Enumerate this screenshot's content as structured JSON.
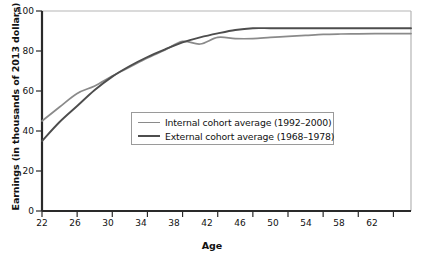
{
  "chart_data": {
    "type": "line",
    "title": "",
    "xlabel": "Age",
    "ylabel": "Earnings (in thousands of 2013 dollars)",
    "xlim": [
      22,
      64
    ],
    "ylim": [
      0,
      100
    ],
    "xticks": [
      22,
      26,
      30,
      34,
      38,
      42,
      46,
      50,
      54,
      58,
      62
    ],
    "yticks": [
      0,
      20,
      40,
      60,
      80,
      100
    ],
    "grid": false,
    "legend_position": "center",
    "x": [
      22,
      24,
      26,
      28,
      30,
      32,
      34,
      36,
      38,
      40,
      42,
      44,
      46,
      48,
      50,
      52,
      54,
      56,
      58,
      60,
      62,
      64
    ],
    "series": [
      {
        "name": "Internal cohort average (1992–2000)",
        "color": "#8a8a8a",
        "values": [
          45.0,
          52.0,
          58.8,
          62.5,
          67.5,
          72.0,
          76.5,
          80.5,
          84.8,
          83.5,
          86.8,
          86.2,
          86.2,
          86.8,
          87.3,
          87.8,
          88.3,
          88.5,
          88.6,
          88.7,
          88.7,
          88.7
        ]
      },
      {
        "name": "External cohort average (1968–1978)",
        "color": "#4d4d4d",
        "values": [
          35.0,
          44.5,
          52.5,
          60.5,
          67.2,
          72.5,
          77.0,
          80.8,
          84.3,
          86.8,
          88.8,
          90.5,
          91.4,
          91.4,
          91.4,
          91.4,
          91.4,
          91.4,
          91.4,
          91.4,
          91.4,
          91.4
        ]
      }
    ]
  },
  "axis": {
    "ytick_labels": [
      "100",
      "80",
      "60",
      "40",
      "20",
      "0"
    ],
    "xtick_labels": [
      "22",
      "26",
      "30",
      "34",
      "38",
      "42",
      "46",
      "50",
      "54",
      "58",
      "62"
    ]
  },
  "legend": {
    "entries": [
      {
        "label": "Internal cohort average (1992–2000)",
        "color": "#8a8a8a"
      },
      {
        "label": "External cohort average (1968–1978)",
        "color": "#4d4d4d"
      }
    ]
  },
  "colors": {
    "internal_line": "#8a8a8a",
    "external_line": "#4d4d4d",
    "axis": "#1a1a1a",
    "frame": "#b0b0b0",
    "background": "#ffffff"
  }
}
